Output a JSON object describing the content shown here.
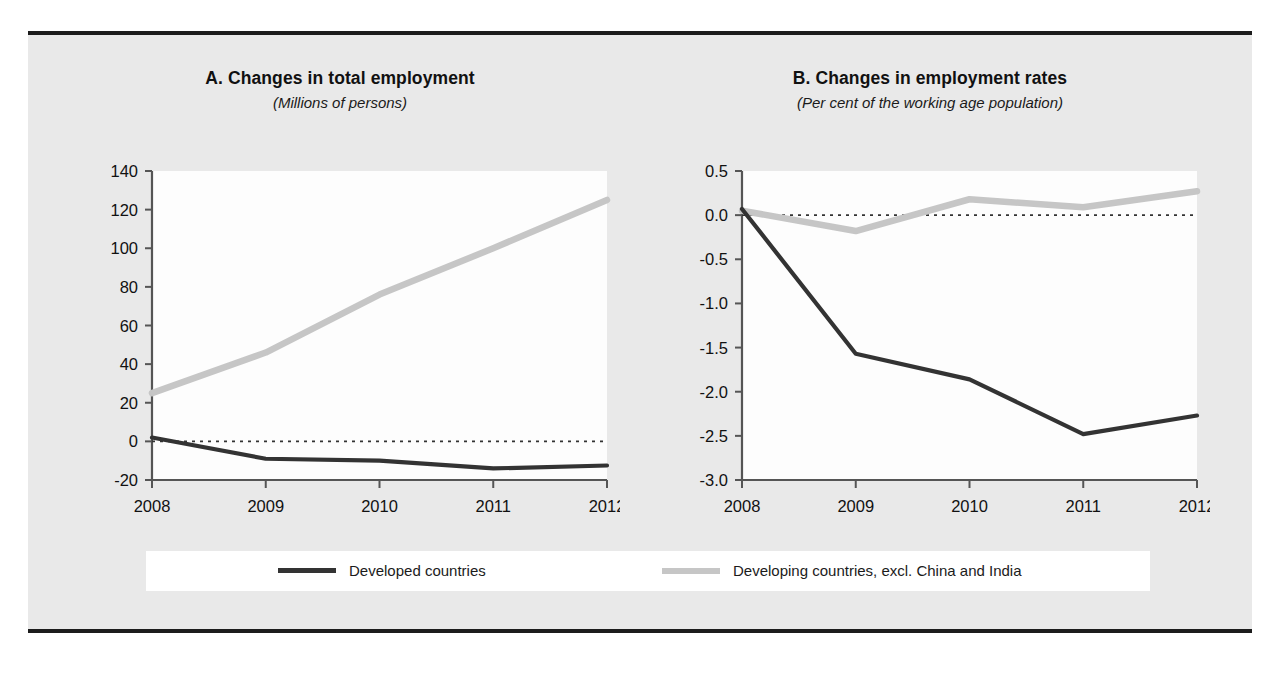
{
  "figure": {
    "background_color": "#e9e9e9",
    "rule_color": "#1c1c1c"
  },
  "legend": {
    "items": [
      {
        "label": "Developed countries",
        "color": "#333333",
        "key": "developed"
      },
      {
        "label": "Developing countries, excl. China and India",
        "color": "#c6c6c6",
        "key": "developing"
      }
    ]
  },
  "chart_data": [
    {
      "id": "panel-a",
      "type": "line",
      "title": "A. Changes in total employment",
      "subtitle": "(Millions of persons)",
      "xlabel": "",
      "ylabel": "",
      "categories": [
        "2008",
        "2009",
        "2010",
        "2011",
        "2012"
      ],
      "x": [
        2008,
        2009,
        2010,
        2011,
        2012
      ],
      "ylim": [
        -20,
        140
      ],
      "yticks": [
        -20,
        0,
        20,
        40,
        60,
        80,
        100,
        120,
        140
      ],
      "ytick_labels": [
        "-20",
        "0",
        "20",
        "40",
        "60",
        "80",
        "100",
        "120",
        "140"
      ],
      "grid": false,
      "zero_line": true,
      "legend_position": "below-figure",
      "series": [
        {
          "name": "Developed countries",
          "color": "#333333",
          "values": [
            2,
            -9,
            -10,
            -14,
            -12.5
          ]
        },
        {
          "name": "Developing countries, excl. China and India",
          "color": "#c6c6c6",
          "values": [
            25,
            46,
            76,
            100,
            125
          ]
        }
      ]
    },
    {
      "id": "panel-b",
      "type": "line",
      "title": "B. Changes in employment rates",
      "subtitle": "(Per cent of the working age population)",
      "xlabel": "",
      "ylabel": "",
      "categories": [
        "2008",
        "2009",
        "2010",
        "2011",
        "2012"
      ],
      "x": [
        2008,
        2009,
        2010,
        2011,
        2012
      ],
      "ylim": [
        -3.0,
        0.5
      ],
      "yticks": [
        -3.0,
        -2.5,
        -2.0,
        -1.5,
        -1.0,
        -0.5,
        0.0,
        0.5
      ],
      "ytick_labels": [
        "-3.0",
        "-2.5",
        "-2.0",
        "-1.5",
        "-1.0",
        "-0.5",
        "0.0",
        "0.5"
      ],
      "grid": false,
      "zero_line": true,
      "legend_position": "below-figure",
      "series": [
        {
          "name": "Developed countries",
          "color": "#333333",
          "values": [
            0.07,
            -1.57,
            -1.86,
            -2.48,
            -2.27
          ]
        },
        {
          "name": "Developing countries, excl. China and India",
          "color": "#c6c6c6",
          "values": [
            0.05,
            -0.18,
            0.18,
            0.09,
            0.27
          ]
        }
      ]
    }
  ]
}
